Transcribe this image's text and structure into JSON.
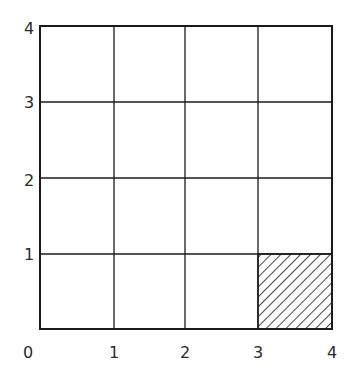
{
  "diagram": {
    "type": "unit-grid",
    "grid_size": 4,
    "x_axis_labels": [
      "0",
      "1",
      "2",
      "3",
      "4"
    ],
    "y_axis_labels": [
      "1",
      "2",
      "3",
      "4"
    ],
    "shaded_cell": {
      "x_from": 3,
      "x_to": 4,
      "y_from": 0,
      "y_to": 1,
      "pattern": "diagonal-hatch"
    },
    "colors": {
      "line": "#1a1a1a",
      "background": "#ffffff"
    }
  }
}
